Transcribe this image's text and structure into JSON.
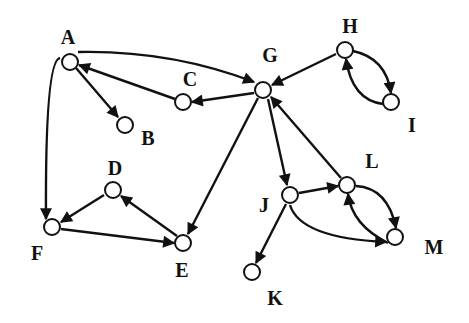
{
  "diagram": {
    "type": "directed-graph",
    "colors": {
      "stroke": "#111111",
      "node_fill": "#ffffff",
      "background": "#ffffff"
    },
    "nodes": [
      {
        "id": "A",
        "label": "A",
        "x": 70,
        "y": 62,
        "lx": 68,
        "ly": 44
      },
      {
        "id": "B",
        "label": "B",
        "x": 125,
        "y": 125,
        "lx": 148,
        "ly": 145
      },
      {
        "id": "C",
        "label": "C",
        "x": 183,
        "y": 102,
        "lx": 190,
        "ly": 86
      },
      {
        "id": "G",
        "label": "G",
        "x": 263,
        "y": 90,
        "lx": 270,
        "ly": 62
      },
      {
        "id": "H",
        "label": "H",
        "x": 345,
        "y": 50,
        "lx": 350,
        "ly": 33
      },
      {
        "id": "I",
        "label": "I",
        "x": 391,
        "y": 102,
        "lx": 412,
        "ly": 132
      },
      {
        "id": "D",
        "label": "D",
        "x": 113,
        "y": 190,
        "lx": 115,
        "ly": 175
      },
      {
        "id": "F",
        "label": "F",
        "x": 52,
        "y": 227,
        "lx": 37,
        "ly": 260
      },
      {
        "id": "E",
        "label": "E",
        "x": 183,
        "y": 243,
        "lx": 182,
        "ly": 277
      },
      {
        "id": "J",
        "label": "J",
        "x": 290,
        "y": 195,
        "lx": 264,
        "ly": 212
      },
      {
        "id": "L",
        "label": "L",
        "x": 347,
        "y": 185,
        "lx": 372,
        "ly": 168
      },
      {
        "id": "M",
        "label": "M",
        "x": 395,
        "y": 237,
        "lx": 434,
        "ly": 254
      },
      {
        "id": "K",
        "label": "K",
        "x": 252,
        "y": 272,
        "lx": 275,
        "ly": 305
      }
    ],
    "edges": [
      {
        "from": "A",
        "to": "G",
        "path": "M78,52 Q170,50 254,82"
      },
      {
        "from": "A",
        "to": "B",
        "path": "M76,68 L118,117"
      },
      {
        "from": "A",
        "to": "F",
        "path": "M60,58 Q45,60 46,219"
      },
      {
        "from": "C",
        "to": "A",
        "path": "M175,99 L79,65"
      },
      {
        "from": "G",
        "to": "C",
        "path": "M254,93 L192,102"
      },
      {
        "from": "G",
        "to": "E",
        "path": "M258,98 L188,234"
      },
      {
        "from": "G",
        "to": "J",
        "path": "M268,99 L287,185"
      },
      {
        "from": "H",
        "to": "G",
        "path": "M336,54 L272,85"
      },
      {
        "from": "H",
        "to": "I",
        "path": "M353,51 Q386,58 391,93"
      },
      {
        "from": "I",
        "to": "H",
        "path": "M383,104 Q352,100 346,59"
      },
      {
        "from": "D",
        "to": "F",
        "path": "M104,195 L61,222"
      },
      {
        "from": "F",
        "to": "E",
        "path": "M61,229 L174,243"
      },
      {
        "from": "E",
        "to": "D",
        "path": "M177,236 L121,196"
      },
      {
        "from": "L",
        "to": "G",
        "path": "M341,178 L271,97"
      },
      {
        "from": "J",
        "to": "L",
        "path": "M299,193 L338,186"
      },
      {
        "from": "J",
        "to": "M",
        "path": "M290,205 Q300,238 386,242"
      },
      {
        "from": "J",
        "to": "K",
        "path": "M286,204 L256,263"
      },
      {
        "from": "L",
        "to": "M",
        "path": "M356,186 Q388,188 396,228"
      },
      {
        "from": "M",
        "to": "L",
        "path": "M388,243 Q352,225 348,194"
      }
    ]
  }
}
